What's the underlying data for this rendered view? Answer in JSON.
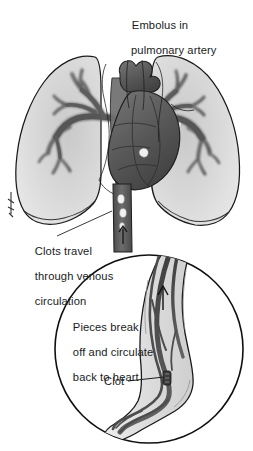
{
  "figure": {
    "name": "pulmonary-embolism-illustration",
    "kind": "medical-line-drawing",
    "width": 253,
    "height": 451,
    "background": "#ffffff"
  },
  "captions": {
    "title_line1": "Embolus in",
    "title_line2": "pulmonary artery",
    "clots_line1": "Clots travel",
    "clots_line2": "through venous",
    "clots_line3": "circulation",
    "pieces_line1": "Pieces break",
    "pieces_line2": "off and circulate",
    "pieces_line3": "back to heart",
    "clot_label": "Clot"
  },
  "colors": {
    "ink": "#1b1b1b",
    "outline": "#141414",
    "lung_fill": "#d6d6d6",
    "lung_fill_light": "#e2e2e2",
    "vessel_dark": "#5a5a5a",
    "vessel_mid": "#777777",
    "heart_dark": "#4e4e4e",
    "heart_mid": "#6a6a6a",
    "leg_fill": "#dddddd",
    "vein_dark": "#4a4a4a",
    "embolus_light": "#f2f2f2",
    "leader_line": "#3a3a3a",
    "inset_ring": "#101010"
  },
  "upper_panel": {
    "name": "thorax-view",
    "parts": [
      {
        "name": "left-lung",
        "label": "left lung",
        "fill": "#d6d6d6"
      },
      {
        "name": "right-lung",
        "label": "right lung",
        "fill": "#d6d6d6"
      },
      {
        "name": "left-pulmonary-artery-tree",
        "label": "pulmonary arterial tree"
      },
      {
        "name": "right-pulmonary-artery-tree",
        "label": "pulmonary arterial tree"
      },
      {
        "name": "heart",
        "label": "heart"
      },
      {
        "name": "aortic-arch",
        "label": "aortic arch"
      },
      {
        "name": "superior-vena-cava",
        "label": "superior vena cava"
      },
      {
        "name": "inferior-vena-cava",
        "label": "inferior vena cava"
      },
      {
        "name": "embolus-in-pulmonary-artery",
        "label": "embolus"
      },
      {
        "name": "travelling-emboli",
        "label": "clot fragments in vena cava",
        "count": 3
      },
      {
        "name": "upward-flow-arrow",
        "label": "direction of blood flow"
      }
    ]
  },
  "inset_panel": {
    "name": "leg-vein-inset",
    "shape": "circle",
    "center_x": 149,
    "center_y": 349,
    "radius": 95,
    "parts": [
      {
        "name": "lower-leg",
        "label": "lower leg and foot"
      },
      {
        "name": "deep-vein",
        "label": "deep leg vein"
      },
      {
        "name": "superficial-vein",
        "label": "superficial vein"
      },
      {
        "name": "clot-in-vein",
        "label": "clot"
      },
      {
        "name": "upward-flow-arrow",
        "label": "flow toward heart"
      }
    ]
  },
  "leaders": [
    {
      "name": "clots-travel-leader",
      "from": "clots-caption",
      "to": "inferior-vena-cava"
    },
    {
      "name": "clot-leader",
      "from": "clot-caption",
      "to": "clot-in-vein"
    }
  ]
}
